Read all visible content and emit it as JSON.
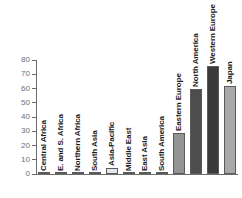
{
  "chart_data": {
    "type": "bar",
    "title": "",
    "subtitle": "",
    "xlabel": "",
    "ylabel": "",
    "ylim": [
      0,
      80
    ],
    "yticks": [
      0,
      10,
      20,
      30,
      40,
      50,
      60,
      70,
      80
    ],
    "grid": false,
    "legend": "none",
    "orientation": "vertical",
    "label_rotation": 90,
    "categories": [
      "Central Africa",
      "E. and S. Africa",
      "Northern Africa",
      "South Asia",
      "Asia-Pacific",
      "Middle East",
      "East Asia",
      "South America",
      "Eastern Europe",
      "North America",
      "Western Europe",
      "Japan"
    ],
    "values": [
      0.8,
      0.8,
      0.8,
      0.8,
      4.5,
      0.8,
      0.8,
      0.8,
      29,
      60,
      75.5,
      62
    ],
    "bar_colors": [
      "#8f8f8f",
      "#8f8f8f",
      "#8f8f8f",
      "#8f8f8f",
      "#e8e8e8",
      "#8f8f8f",
      "#8f8f8f",
      "#8f8f8f",
      "#949494",
      "#4d4d4d",
      "#3a3a3a",
      "#a8a8a8"
    ]
  },
  "axis": {
    "tick_color": "#6e6e6e",
    "line_color": "#6e6e6e"
  },
  "colors": {
    "background": "#ffffff",
    "bar_edge": "#5a5a5a",
    "label_text": "#1a1a1a"
  }
}
